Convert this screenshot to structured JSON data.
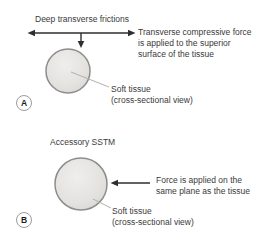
{
  "colors": {
    "background": "#ffffff",
    "text": "#3a3a3a",
    "arrow": "#2e2e2e",
    "circle_fill": "#e3e2df",
    "circle_highlight": "#efeeec",
    "circle_border": "#8d8d8d",
    "leader_line": "#b3b1ae",
    "badge_border": "#9b9b9b"
  },
  "figure": {
    "panels": [
      {
        "badge": "A",
        "title": "Deep transverse frictions",
        "annotation": "Transverse compressive force\nis applied to the superior\nsurface of the tissue",
        "tissue_label": "Soft tissue\n(cross-sectional view)"
      },
      {
        "badge": "B",
        "title": "Accessory SSTM",
        "annotation": "Force is applied on the\nsame plane as the tissue",
        "tissue_label": "Soft tissue\n(cross-sectional view)"
      }
    ]
  }
}
